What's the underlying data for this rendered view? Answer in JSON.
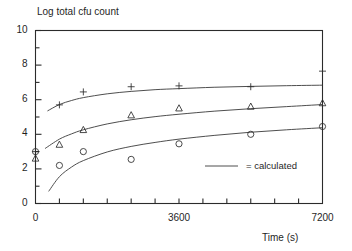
{
  "chart_data": {
    "type": "scatter",
    "title": "Log total cfu count",
    "xlabel": "Time (s)",
    "ylabel": "",
    "xlim": [
      0,
      7200
    ],
    "ylim": [
      0,
      10
    ],
    "grid": false,
    "x_ticks": [
      0,
      3600,
      7200
    ],
    "x_tick_labels": [
      "0",
      "3600",
      "7200"
    ],
    "x_minor_tick_count": 12,
    "y_ticks": [
      0,
      2,
      4,
      6,
      8,
      10
    ],
    "y_tick_labels": [
      "0",
      "2",
      "4",
      "6",
      "8",
      "10"
    ],
    "y_minor_ticks": [
      1,
      3,
      5,
      7,
      9
    ],
    "legend": {
      "position": "inside-lower-right",
      "entries": [
        {
          "marker": "line",
          "equals": "=",
          "label": "calculated",
          "text": "=  calculated"
        }
      ]
    },
    "series": [
      {
        "name": "plus-series",
        "marker": "plus",
        "x": [
          0,
          600,
          1200,
          2400,
          3600,
          5400,
          7200
        ],
        "y": [
          3.0,
          5.7,
          6.45,
          6.75,
          6.8,
          6.75,
          7.65
        ],
        "fit_label": "calculated",
        "fit_curve": [
          [
            300,
            5.35
          ],
          [
            600,
            5.72
          ],
          [
            900,
            5.95
          ],
          [
            1200,
            6.12
          ],
          [
            1800,
            6.34
          ],
          [
            2400,
            6.48
          ],
          [
            3000,
            6.58
          ],
          [
            3600,
            6.64
          ],
          [
            4500,
            6.72
          ],
          [
            5400,
            6.77
          ],
          [
            6300,
            6.81
          ],
          [
            7200,
            6.84
          ]
        ]
      },
      {
        "name": "triangle-series",
        "marker": "triangle",
        "x": [
          0,
          600,
          1200,
          2400,
          3600,
          5400,
          7200
        ],
        "y": [
          2.6,
          3.4,
          4.25,
          5.1,
          5.5,
          5.6,
          5.8
        ],
        "fit_label": "calculated",
        "fit_curve": [
          [
            240,
            3.18
          ],
          [
            600,
            3.72
          ],
          [
            900,
            4.02
          ],
          [
            1200,
            4.26
          ],
          [
            1800,
            4.6
          ],
          [
            2400,
            4.84
          ],
          [
            3000,
            5.02
          ],
          [
            3600,
            5.16
          ],
          [
            4500,
            5.34
          ],
          [
            5400,
            5.48
          ],
          [
            6300,
            5.6
          ],
          [
            7200,
            5.72
          ]
        ]
      },
      {
        "name": "circle-series",
        "marker": "circle",
        "x": [
          0,
          600,
          1200,
          2400,
          3600,
          5400,
          7200
        ],
        "y": [
          3.0,
          2.2,
          3.0,
          2.55,
          3.45,
          4.0,
          4.45
        ],
        "fit_label": "calculated",
        "fit_curve": [
          [
            330,
            0.7
          ],
          [
            600,
            1.55
          ],
          [
            900,
            2.1
          ],
          [
            1200,
            2.48
          ],
          [
            1800,
            2.98
          ],
          [
            2400,
            3.3
          ],
          [
            3000,
            3.53
          ],
          [
            3600,
            3.72
          ],
          [
            4500,
            3.94
          ],
          [
            5400,
            4.12
          ],
          [
            6300,
            4.26
          ],
          [
            7200,
            4.38
          ]
        ]
      }
    ]
  }
}
